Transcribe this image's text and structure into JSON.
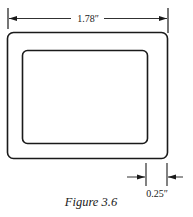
{
  "figure": {
    "caption": "Figure 3.6"
  },
  "dimensions": {
    "overall_width": {
      "label": "1.78″",
      "value": 1.78,
      "unit": "in"
    },
    "frame_thickness": {
      "label": "0.25″",
      "value": 0.25,
      "unit": "in"
    }
  },
  "shapes": {
    "outer_rect": {
      "x": 7.5,
      "y": 32.5,
      "width": 160,
      "height": 126,
      "corner_radius": 6
    },
    "inner_rect": {
      "x": 22.5,
      "y": 50.5,
      "width": 125,
      "height": 93,
      "corner_radius": 5
    }
  },
  "colors": {
    "line": "#1a1a1a",
    "background": "#ffffff"
  }
}
